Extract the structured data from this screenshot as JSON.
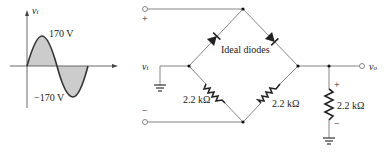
{
  "waveform": {
    "axis_label": "v",
    "axis_label_sub": "i",
    "positive_peak": "170 V",
    "negative_peak": "−170 V",
    "fill_color": "#cccccc",
    "stroke_color": "#333333"
  },
  "circuit": {
    "input_label": "v",
    "input_label_sub": "i",
    "input_plus": "+",
    "input_minus": "−",
    "diodes_label": "Ideal diodes",
    "resistor_left": "2.2 kΩ",
    "resistor_right": "2.2 kΩ",
    "resistor_load": "2.2 kΩ",
    "output_label": "v",
    "output_label_sub": "o",
    "load_plus": "+",
    "load_minus": "−",
    "wire_color": "#777777"
  }
}
